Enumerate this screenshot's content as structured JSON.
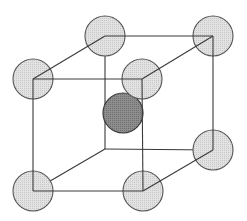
{
  "diagram": {
    "colors": {
      "background": "#ffffff",
      "edge": "#3a3a3a",
      "corner_atom_fill": "#d9d9d9",
      "corner_atom_stroke": "#555555",
      "center_atom_fill": "#8a8a8a",
      "center_atom_stroke": "#3a3a3a"
    },
    "atom_radius": 20,
    "vertices": {
      "back_top_left": [
        105,
        36
      ],
      "back_top_right": [
        213,
        36
      ],
      "back_bottom_left": [
        105,
        149
      ],
      "back_bottom_right": [
        213,
        150
      ],
      "front_top_left": [
        33,
        79
      ],
      "front_top_right": [
        142,
        79
      ],
      "front_bottom_left": [
        33,
        191
      ],
      "front_bottom_right": [
        143,
        191
      ]
    },
    "center_atom": [
      123,
      113
    ],
    "visible_corner_atoms": [
      "back_top_left",
      "back_top_right",
      "front_top_left",
      "front_top_right",
      "back_bottom_right",
      "front_bottom_left",
      "front_bottom_right"
    ]
  }
}
